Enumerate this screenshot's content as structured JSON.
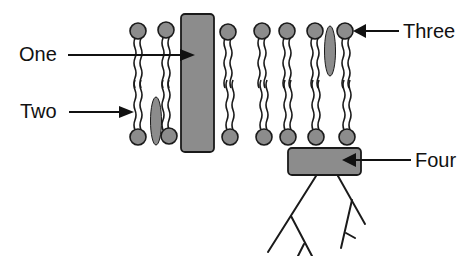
{
  "diagram": {
    "labels": {
      "one": "One",
      "two": "Two",
      "three": "Three",
      "four": "Four"
    },
    "colors": {
      "fill": "#8c8c8c",
      "stroke": "#1a1a1a",
      "background": "#ffffff"
    },
    "components": [
      {
        "id": "one",
        "depicts": "transmembrane protein"
      },
      {
        "id": "two",
        "depicts": "cholesterol / inner leaflet molecule"
      },
      {
        "id": "three",
        "depicts": "cholesterol / outer leaflet molecule"
      },
      {
        "id": "four",
        "depicts": "peripheral protein with glycocalyx branches"
      }
    ]
  }
}
